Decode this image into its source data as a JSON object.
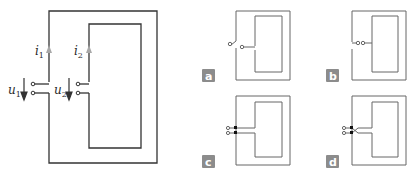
{
  "main_diagram": {
    "labels": {
      "i1": "i",
      "i1_sub": "1",
      "i2": "i",
      "i2_sub": "2",
      "u1": "u",
      "u1_sub": "1",
      "u2": "u",
      "u2_sub": "2"
    },
    "colors": {
      "wire": "#333333",
      "current_arrow": "#a8a8a8",
      "voltage_arrow": "#333333"
    }
  },
  "options": [
    {
      "id": "a",
      "label": "a",
      "description": "outer loop terminals left open, inner loop terminals separate"
    },
    {
      "id": "b",
      "label": "b",
      "description": "outer and inner loop terminals joined side-by-side"
    },
    {
      "id": "c",
      "label": "c",
      "description": "terminals stacked, connected straight"
    },
    {
      "id": "d",
      "label": "d",
      "description": "terminals stacked, crossed connection"
    }
  ],
  "colors": {
    "badge": "#8c8c8c",
    "small_wire": "#666666"
  }
}
